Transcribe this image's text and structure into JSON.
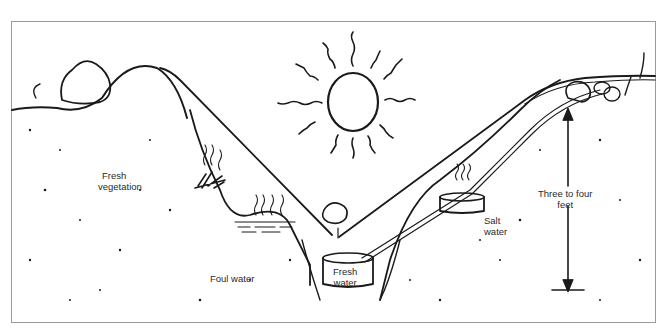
{
  "diagram": {
    "type": "solar still cross-section illustration",
    "colors": {
      "ink": "#1a1a1a",
      "background": "#ffffff",
      "frame": "#9a9a9a",
      "label": "#2a2a2a"
    },
    "labels": {
      "fresh_vegetation": {
        "line1": "Fresh",
        "line2": "vegetation"
      },
      "foul_water": "Foul water",
      "fresh_water": {
        "line1": "Fresh",
        "line2": "water"
      },
      "salt_water": {
        "line1": "Salt",
        "line2": "water"
      },
      "depth": {
        "line1": "Three to four",
        "line2": "feet"
      }
    },
    "elements": [
      "sun-icon",
      "plastic-sheet",
      "center-rock-weight",
      "collection-container",
      "drinking-tube",
      "salt-water-pan",
      "foul-water-pool",
      "vegetation",
      "edge-rocks",
      "depth-arrow"
    ]
  }
}
